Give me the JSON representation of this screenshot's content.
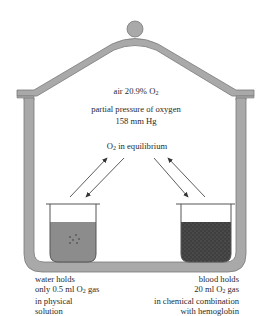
{
  "diagram": {
    "type": "bell-jar-oxygen-equilibrium",
    "colors": {
      "jar": "#a9a9a9",
      "jar_stroke": "#7a7a7a",
      "water": "#8c8c8c",
      "blood": "#3f3f3f",
      "text": "#2a2a2a"
    },
    "air": {
      "line1": "air 20.9% O",
      "line1_sub": "2",
      "line2": "partial pressure of oxygen",
      "line3": "158 mm Hg"
    },
    "equilibrium": {
      "prefix": "O",
      "sub": "2",
      "suffix": " in equilibrium"
    },
    "water": {
      "line1": "water holds",
      "line2_a": "only 0.5 ml O",
      "line2_sub": "2",
      "line2_b": " gas",
      "line3": "in physical",
      "line4": "solution"
    },
    "blood": {
      "line1": "blood holds",
      "line2_a": "20 ml O",
      "line2_sub": "2",
      "line2_b": " gas",
      "line3": "in chemical combination",
      "line4": "with hemoglobin"
    }
  }
}
